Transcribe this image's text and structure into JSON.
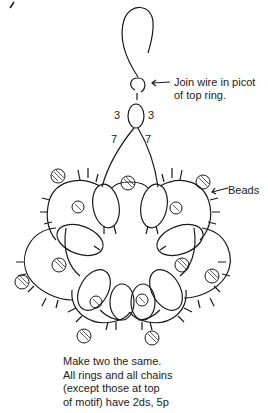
{
  "labels": {
    "join_wire": [
      "Join wire in picot",
      "of top ring."
    ],
    "beads": "Beads"
  },
  "counts": {
    "top_ring_left": "3",
    "top_ring_right": "3",
    "chain_left": "7",
    "chain_right": "7"
  },
  "note": [
    "Make two the same.",
    "All rings and all chains",
    "(except those at top",
    "of motif) have 2ds, 5p"
  ],
  "colors": {
    "line": "#1a1a1a",
    "background": "#ffffff"
  }
}
